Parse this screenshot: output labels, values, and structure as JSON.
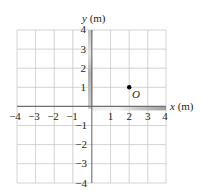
{
  "diagram": {
    "type": "coordinate-grid",
    "x_axis_label": "x (m)",
    "y_axis_label": "y (m)",
    "x_ticks": [
      {
        "value": -4,
        "label": "−4"
      },
      {
        "value": -3,
        "label": "−3"
      },
      {
        "value": -2,
        "label": "−2"
      },
      {
        "value": -1,
        "label": "−1"
      },
      {
        "value": 1,
        "label": "1"
      },
      {
        "value": 2,
        "label": "2"
      },
      {
        "value": 3,
        "label": "3"
      },
      {
        "value": 4,
        "label": "4"
      }
    ],
    "y_ticks": [
      {
        "value": 4,
        "label": "4"
      },
      {
        "value": 3,
        "label": "3"
      },
      {
        "value": 2,
        "label": "2"
      },
      {
        "value": 1,
        "label": "1"
      },
      {
        "value": -1,
        "label": "−1"
      },
      {
        "value": -2,
        "label": "−2"
      },
      {
        "value": -3,
        "label": "−3"
      },
      {
        "value": -4,
        "label": "−4"
      }
    ],
    "range": {
      "x": [
        -4,
        4
      ],
      "y": [
        -4,
        4
      ]
    },
    "point": {
      "label": "O",
      "x": 2,
      "y": 1
    },
    "colors": {
      "grid": "#c8c8c8",
      "axis": "#6d6e71",
      "text": "#231f20",
      "point": "#000000"
    }
  }
}
